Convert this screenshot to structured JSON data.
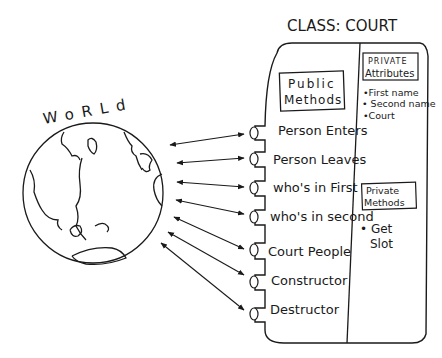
{
  "diagram": {
    "world_label": "WoRLd",
    "class_title": "CLASS: COURT",
    "public_methods_header": [
      "Public",
      "Methods"
    ],
    "public_methods": [
      "Person Enters",
      "Person Leaves",
      "who's in First",
      "who's in second",
      "Court People",
      "Constructor",
      "Destructor"
    ],
    "private_attributes_header": [
      "PRIVATE",
      "Attributes"
    ],
    "private_attributes": [
      "•First name",
      "• Second name",
      "•Court"
    ],
    "private_methods_header": [
      "Private",
      "Methods"
    ],
    "private_methods": [
      "• Get",
      "Slot"
    ],
    "ink_color": "#1a1a1a"
  }
}
